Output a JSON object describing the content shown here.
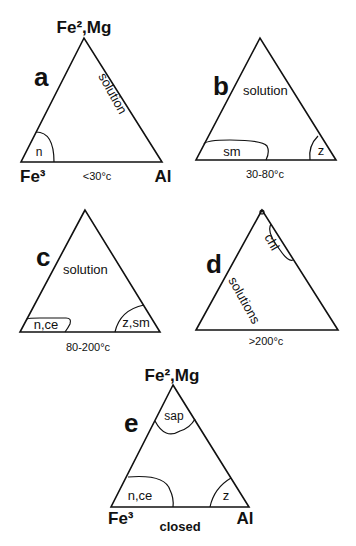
{
  "figure": {
    "panels": [
      {
        "id": "a",
        "letter": "a",
        "top_vertex": "Fe²,Mg",
        "left_vertex": "Fe³",
        "right_vertex": "Al",
        "condition": "<30°c",
        "fields": [
          "solution",
          "n"
        ]
      },
      {
        "id": "b",
        "letter": "b",
        "condition": "30-80°c",
        "fields": [
          "solution",
          "sm",
          "z"
        ]
      },
      {
        "id": "c",
        "letter": "c",
        "condition": "80-200°c",
        "fields": [
          "solution",
          "n,ce",
          "z,sm"
        ]
      },
      {
        "id": "d",
        "letter": "d",
        "condition": ">200°c",
        "fields": [
          "chl",
          "solutions"
        ]
      },
      {
        "id": "e",
        "letter": "e",
        "top_vertex": "Fe²,Mg",
        "left_vertex": "Fe³",
        "right_vertex": "Al",
        "condition": "closed",
        "fields": [
          "sap",
          "n,ce",
          "z"
        ]
      }
    ]
  }
}
